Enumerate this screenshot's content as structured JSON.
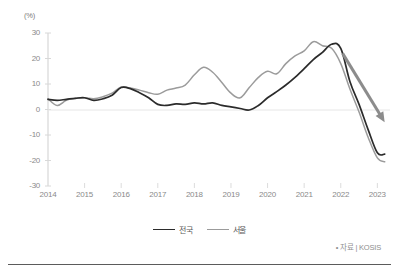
{
  "axes": {
    "unit_label": "(%)",
    "y_ticks": [
      30,
      20,
      10,
      0,
      -10,
      -20,
      -30
    ],
    "x_ticks": [
      "2014",
      "2015",
      "2016",
      "2017",
      "2018",
      "2019",
      "2020",
      "2021",
      "2022",
      "2023"
    ]
  },
  "legend": {
    "items": [
      {
        "label": "전국",
        "color": "#2b2b2b"
      },
      {
        "label": "서울",
        "color": "#9b9b9b"
      }
    ]
  },
  "source": {
    "text": "• 자료 | KOSIS"
  },
  "annotation": {
    "arrow_name": "downward-trend-arrow",
    "color": "#8c8c8c"
  },
  "chart_data": {
    "type": "line",
    "title": "",
    "xlabel": "",
    "ylabel": "(%)",
    "ylim": [
      -30,
      30
    ],
    "xlim": [
      2014.0,
      2023.4
    ],
    "grid": false,
    "zero_line": true,
    "legend_position": "bottom-center",
    "annotations": [
      {
        "type": "arrow",
        "from": [
          2022.05,
          22.0
        ],
        "to": [
          2023.2,
          -5.0
        ],
        "color": "#8c8c8c",
        "text": ""
      }
    ],
    "series": [
      {
        "name": "전국",
        "color": "#2b2b2b",
        "x": [
          2014.0,
          2014.25,
          2014.5,
          2014.75,
          2015.0,
          2015.25,
          2015.5,
          2015.75,
          2016.0,
          2016.25,
          2016.5,
          2016.75,
          2017.0,
          2017.25,
          2017.5,
          2017.75,
          2018.0,
          2018.25,
          2018.5,
          2018.75,
          2019.0,
          2019.25,
          2019.5,
          2019.75,
          2020.0,
          2020.25,
          2020.5,
          2020.75,
          2021.0,
          2021.25,
          2021.5,
          2021.75,
          2022.0,
          2022.25,
          2022.5,
          2022.75,
          2023.0,
          2023.2
        ],
        "values": [
          4.0,
          3.6,
          4.0,
          4.4,
          4.6,
          3.6,
          4.2,
          5.6,
          8.6,
          8.2,
          6.6,
          4.6,
          2.0,
          1.6,
          2.2,
          2.0,
          2.6,
          2.2,
          2.6,
          1.6,
          1.0,
          0.4,
          -0.2,
          1.6,
          4.6,
          7.0,
          9.6,
          12.6,
          16.0,
          19.6,
          22.4,
          25.6,
          24.0,
          11.0,
          2.0,
          -8.0,
          -17.0,
          -17.5
        ]
      },
      {
        "name": "서울",
        "color": "#9b9b9b",
        "x": [
          2014.0,
          2014.25,
          2014.5,
          2014.75,
          2015.0,
          2015.25,
          2015.5,
          2015.75,
          2016.0,
          2016.25,
          2016.5,
          2016.75,
          2017.0,
          2017.25,
          2017.5,
          2017.75,
          2018.0,
          2018.25,
          2018.5,
          2018.75,
          2019.0,
          2019.25,
          2019.5,
          2019.75,
          2020.0,
          2020.25,
          2020.5,
          2020.75,
          2021.0,
          2021.25,
          2021.5,
          2021.75,
          2022.0,
          2022.25,
          2022.5,
          2022.75,
          2023.0,
          2023.2
        ],
        "values": [
          4.2,
          1.6,
          3.6,
          4.4,
          4.6,
          4.2,
          5.0,
          6.4,
          8.8,
          8.4,
          7.6,
          6.6,
          6.0,
          7.6,
          8.4,
          9.6,
          13.6,
          16.6,
          14.6,
          10.6,
          6.4,
          4.6,
          8.6,
          12.6,
          15.0,
          14.0,
          18.0,
          21.0,
          23.0,
          26.6,
          25.0,
          24.0,
          18.0,
          8.0,
          -1.0,
          -11.0,
          -19.0,
          -20.5
        ]
      }
    ]
  }
}
